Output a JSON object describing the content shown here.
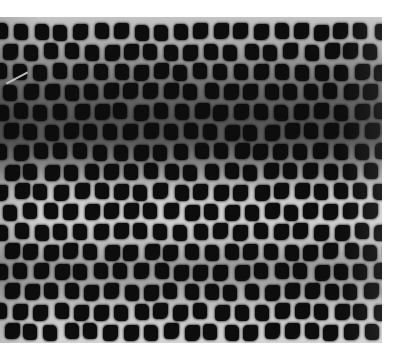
{
  "image": {
    "description": "Grayscale micrograph of a staggered grid of dark square-ish dots on a gray background with horizontal light/dark banding",
    "width": 401,
    "height": 363,
    "photo_region": {
      "x": 0,
      "y": 17,
      "width": 382,
      "height": 326
    },
    "grid": {
      "rows": 16,
      "row_spacing_px": 20,
      "col_spacing_px": 20,
      "odd_row_offset_px": 10,
      "first_row_center_y": 15,
      "dot_size_px": [
        14,
        16
      ]
    },
    "colors": {
      "dot": "#0d0d0d",
      "background_light": "#d2d2d2",
      "background_dark": "#555555",
      "page": "#ffffff"
    },
    "artifact": {
      "type": "light-streak",
      "x": 5,
      "y": 60,
      "length": 24,
      "angle_deg": -28
    }
  }
}
